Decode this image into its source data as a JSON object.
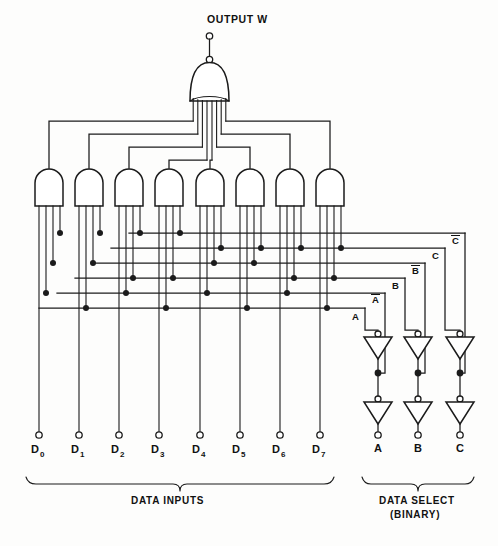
{
  "output": {
    "label": "OUTPUT W",
    "gate_type": "or-gate",
    "inputs": 8
  },
  "data_inputs": {
    "group_label": "DATA INPUTS",
    "labels": [
      "D",
      "D",
      "D",
      "D",
      "D",
      "D",
      "D",
      "D"
    ],
    "subscripts": [
      "0",
      "1",
      "2",
      "3",
      "4",
      "5",
      "6",
      "7"
    ],
    "count": 8
  },
  "data_select": {
    "group_label": "DATA SELECT",
    "group_sublabel": "(BINARY)",
    "labels": [
      "A",
      "B",
      "C"
    ],
    "count": 3
  },
  "select_lines": [
    {
      "name": "A",
      "label": "A",
      "overbar": false,
      "level": 0
    },
    {
      "name": "Ab",
      "label": "A",
      "overbar": true,
      "level": 1
    },
    {
      "name": "B",
      "label": "B",
      "overbar": false,
      "level": 2
    },
    {
      "name": "Bb",
      "label": "B",
      "overbar": true,
      "level": 3
    },
    {
      "name": "C",
      "label": "C",
      "overbar": false,
      "level": 4
    },
    {
      "name": "Cb",
      "label": "C",
      "overbar": true,
      "level": 5
    }
  ],
  "and_gates": {
    "count": 8,
    "inputs_per_gate": 4,
    "select_matrix": [
      [
        "Ab",
        "Bb",
        "Cb"
      ],
      [
        "A",
        "Bb",
        "Cb"
      ],
      [
        "Ab",
        "B",
        "Cb"
      ],
      [
        "A",
        "B",
        "Cb"
      ],
      [
        "Ab",
        "Bb",
        "C"
      ],
      [
        "A",
        "Bb",
        "C"
      ],
      [
        "Ab",
        "B",
        "C"
      ],
      [
        "A",
        "B",
        "C"
      ]
    ]
  },
  "inverters": {
    "count": 6,
    "rows": 2,
    "columns": 3,
    "column_labels": [
      "A",
      "B",
      "C"
    ],
    "shape": "triangle-with-bubble"
  },
  "colors": {
    "ink": "#1b1b1b",
    "paper": "#fdfdfc",
    "gate_fill": "#ffffff"
  }
}
